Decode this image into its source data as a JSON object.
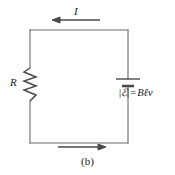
{
  "figure": {
    "caption": "(b)",
    "background_color": "#ffffff",
    "line_color": "#5a5a5a",
    "text_color": "#1a1a1a"
  },
  "labels": {
    "current": "I",
    "resistance": "R",
    "emf_open_bar": "|",
    "emf_symbol": "ℰ",
    "emf_close_bar": "|",
    "emf_equals": "=",
    "emf_value": "Bℓv",
    "emf_full": "|ℰ| = Bℓv"
  },
  "circuit": {
    "loop": {
      "left_x": 30,
      "right_x": 128,
      "top_y": 30,
      "bottom_y": 143
    },
    "components": [
      {
        "name": "resistor",
        "type": "zigzag",
        "orientation": "vertical",
        "label": "R",
        "x": 30,
        "y_start": 68,
        "y_end": 101
      },
      {
        "name": "battery",
        "type": "emf-source",
        "orientation": "horizontal-plates",
        "label": "|ℰ| = Bℓv",
        "x": 128,
        "long_plate_y": 79,
        "short_plate_y": 86
      }
    ],
    "arrows": [
      {
        "name": "top-current-arrow",
        "direction": "left",
        "x_start": 100,
        "x_end": 52,
        "y": 20,
        "label": "I"
      },
      {
        "name": "bottom-current-arrow",
        "direction": "right",
        "x_start": 58,
        "x_end": 106,
        "y": 147,
        "label": ""
      }
    ]
  }
}
